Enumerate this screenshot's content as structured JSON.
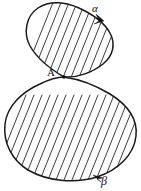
{
  "figure": {
    "background_color": "#ffffff",
    "stroke_color": "#1a1a1a",
    "hatch_color": "#262626",
    "labels": {
      "alpha": "α",
      "beta": "β",
      "intersection_point": "A"
    },
    "loops": [
      {
        "name": "upper-loop",
        "label": "α",
        "orientation": "clockwise",
        "size": "smaller",
        "bounds": {
          "x": 26,
          "y": 2,
          "width": 87,
          "height": 76
        }
      },
      {
        "name": "lower-loop",
        "label": "β",
        "orientation": "counterclockwise",
        "size": "larger",
        "bounds": {
          "x": 4,
          "y": 77,
          "width": 133,
          "height": 102
        }
      }
    ],
    "intersection": {
      "label": "A",
      "x": 64,
      "y": 77
    },
    "arrows": [
      {
        "name": "alpha-direction-arrow",
        "label": "α",
        "x": 103,
        "y": 19,
        "angle_deg": 55
      },
      {
        "name": "beta-direction-arrow",
        "label": "β",
        "x": 96,
        "y": 176,
        "angle_deg": 205
      }
    ],
    "hatching": {
      "angle_deg": 62,
      "spacing_px": 8,
      "direction": "lower-left to upper-right"
    }
  }
}
